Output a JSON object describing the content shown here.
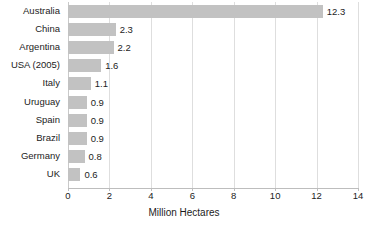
{
  "chart_data": {
    "type": "bar",
    "orientation": "horizontal",
    "title": "",
    "xlabel": "Million Hectares",
    "ylabel": "",
    "xlim": [
      0,
      14
    ],
    "xticks": [
      0,
      2,
      4,
      6,
      8,
      10,
      12,
      14
    ],
    "grid": true,
    "legend": null,
    "bar_color": "#c2c2c2",
    "categories": [
      "Australia",
      "China",
      "Argentina",
      "USA (2005)",
      "Italy",
      "Uruguay",
      "Spain",
      "Brazil",
      "Germany",
      "UK"
    ],
    "values": [
      12.3,
      2.3,
      2.2,
      1.6,
      1.1,
      0.9,
      0.9,
      0.9,
      0.8,
      0.6
    ],
    "value_labels": [
      "12.3",
      "2.3",
      "2.2",
      "1.6",
      "1.1",
      "0.9",
      "0.9",
      "0.9",
      "0.8",
      "0.6"
    ],
    "tick_labels": [
      "0",
      "2",
      "4",
      "6",
      "8",
      "10",
      "12",
      "14"
    ]
  }
}
